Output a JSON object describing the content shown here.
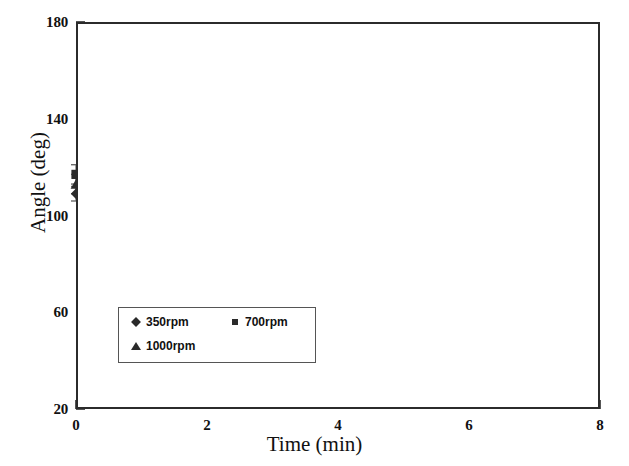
{
  "chart_data": {
    "type": "scatter",
    "title": "",
    "xlabel": "Time (min)",
    "ylabel": "Angle (deg)",
    "xlim": [
      0,
      8
    ],
    "ylim": [
      20,
      180
    ],
    "x_major_ticks": [
      0,
      2,
      4,
      6,
      8
    ],
    "x_minor_ticks": [
      1,
      3,
      5,
      7
    ],
    "y_major_ticks": [
      20,
      60,
      100,
      140,
      180
    ],
    "y_minor_ticks": [
      40,
      80,
      120,
      160
    ],
    "x_tick_labels": [
      "0",
      "2",
      "4",
      "6",
      "8"
    ],
    "y_tick_labels": [
      "20",
      "60",
      "100",
      "140",
      "180"
    ],
    "grid": false,
    "legend_position": "lower-left-inside",
    "error_bars": "vertical",
    "x": [
      0,
      1,
      3,
      5,
      7
    ],
    "series": [
      {
        "name": "350rpm",
        "marker": "diamond",
        "color": "#2a2a2a",
        "values": [
          109,
          138.5,
          147,
          153,
          117
        ],
        "err_low": [
          3,
          6,
          4,
          4,
          62
        ],
        "err_high": [
          3,
          6,
          4,
          5,
          52
        ]
      },
      {
        "name": "700rpm",
        "marker": "square",
        "color": "#2a2a2a",
        "values": [
          117,
          146,
          148,
          115,
          51
        ],
        "err_low": [
          4,
          9,
          7,
          54,
          16
        ],
        "err_high": [
          4,
          9,
          6,
          38,
          17
        ]
      },
      {
        "name": "1000rpm",
        "marker": "triangle",
        "color": "#2a2a2a",
        "values": [
          113,
          141,
          149,
          84,
          67
        ],
        "err_low": [
          4,
          7,
          6,
          23,
          32
        ],
        "err_high": [
          4,
          7,
          5,
          31,
          102
        ]
      }
    ]
  },
  "axes": {
    "x_title": "Time (min)",
    "y_title": "Angle (deg)"
  },
  "legend": {
    "entries": [
      {
        "label": "350rpm",
        "marker": "diamond"
      },
      {
        "label": "700rpm",
        "marker": "square"
      },
      {
        "label": "1000rpm",
        "marker": "triangle"
      }
    ]
  },
  "style": {
    "frame_color": "#2b2b2b",
    "marker_color": "#2a2a2a",
    "background": "#ffffff",
    "errorbar_color": "#6a6a6a"
  }
}
